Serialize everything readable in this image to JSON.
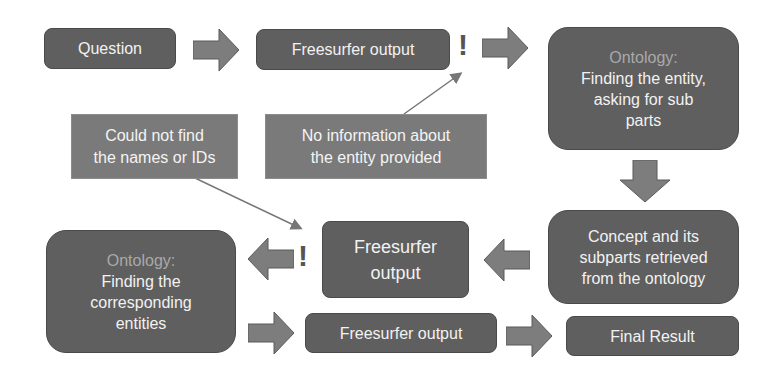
{
  "diagram": {
    "nodes": {
      "question": {
        "label": "Question"
      },
      "freesurfer_top": {
        "label": "Freesurfer output"
      },
      "ontology_top": {
        "heading": "Ontology:",
        "lines": [
          "Finding the entity,",
          "asking for sub",
          "parts"
        ]
      },
      "concept": {
        "lines": [
          "Concept and its",
          "subparts retrieved",
          "from the ontology"
        ]
      },
      "freesurfer_mid": {
        "lines": [
          "Freesurfer",
          "output"
        ]
      },
      "ontology_bottom": {
        "heading": "Ontology:",
        "lines": [
          "Finding the",
          "corresponding",
          "entities"
        ]
      },
      "freesurfer_bottom": {
        "label": "Freesurfer output"
      },
      "final_result": {
        "label": "Final Result"
      }
    },
    "callouts": {
      "could_not_find": {
        "lines": [
          "Could not find",
          "the names or IDs"
        ]
      },
      "no_information": {
        "lines": [
          "No information about",
          "the entity provided"
        ]
      }
    },
    "warning_symbol": "!",
    "colors": {
      "box": "#5f5f5f",
      "callout": "#7a7a7a",
      "arrow": "#7d7d7d",
      "heading": "#a9a9a9",
      "text": "#f2f2f2"
    }
  }
}
